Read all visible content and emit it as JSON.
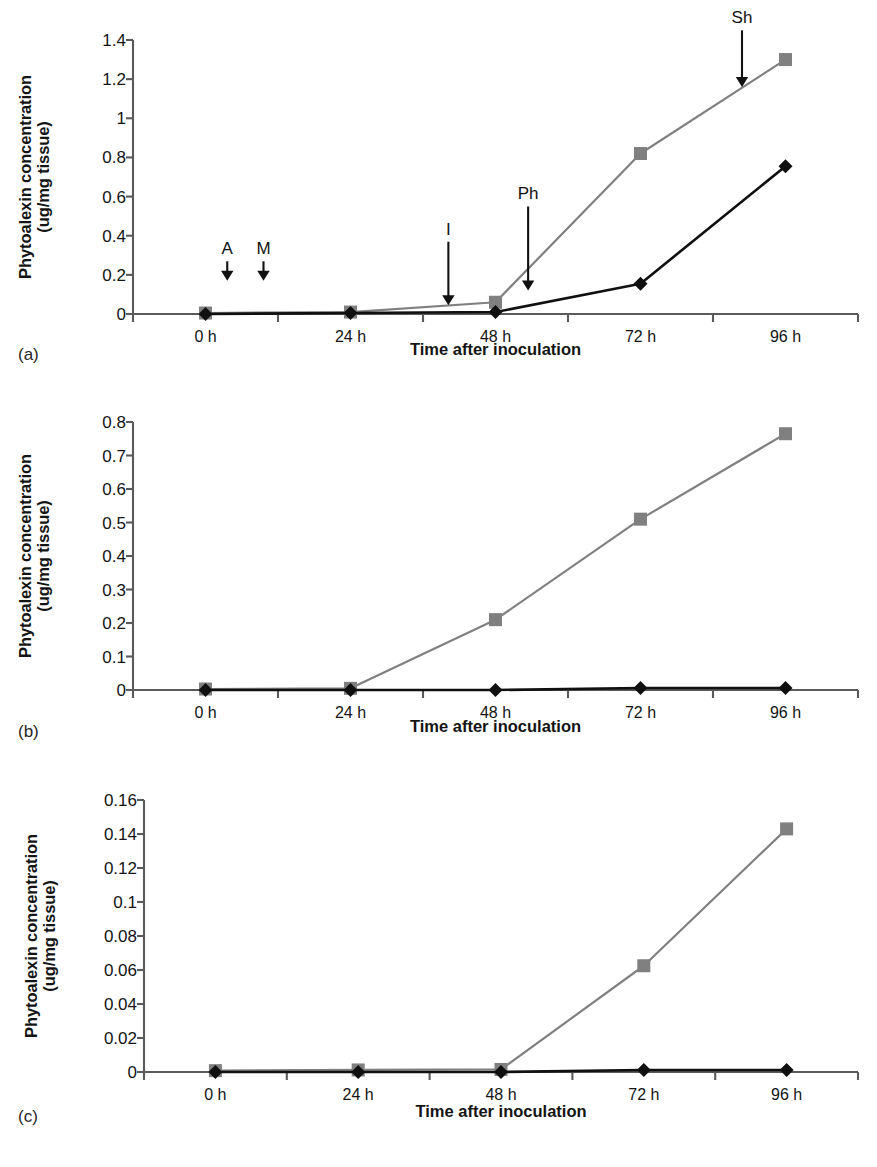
{
  "figure": {
    "background": "#ffffff",
    "series_colors": {
      "squares": "#808080",
      "diamonds": "#101010"
    },
    "axis_color": "#5a5a5a"
  },
  "axis_titles": {
    "y_line1": "Phytoalexin concentration",
    "y_line2": "(ug/mg tissue)",
    "x": "Time after inoculation"
  },
  "panel_letters": {
    "a": "(a)",
    "b": "(b)",
    "c": "(c)"
  },
  "annotations": {
    "a": "A",
    "m": "M",
    "i": "I",
    "ph": "Ph",
    "sh": "Sh"
  },
  "chart_data": [
    {
      "id": "a",
      "type": "line",
      "title": "",
      "panel_label": "(a)",
      "xlabel": "Time after inoculation",
      "ylabel": "Phytoalexin concentration (ug/mg tissue)",
      "categories": [
        "0 h",
        "24 h",
        "48 h",
        "72 h",
        "96 h"
      ],
      "ylim": [
        0,
        1.4
      ],
      "ytick_step": 0.2,
      "yticks": [
        0,
        0.2,
        0.4,
        0.6,
        0.8,
        1,
        1.2,
        1.4
      ],
      "ytick_labels": [
        "0",
        "0.2",
        "0.4",
        "0.6",
        "0.8",
        "1",
        "1.2",
        "1.4"
      ],
      "grid": false,
      "legend": "none",
      "series": [
        {
          "name": "squares",
          "marker": "square",
          "color": "#808080",
          "values": [
            0.005,
            0.01,
            0.06,
            0.82,
            1.3
          ]
        },
        {
          "name": "diamonds",
          "marker": "diamond",
          "color": "#101010",
          "values": [
            0.0,
            0.005,
            0.01,
            0.155,
            0.755
          ]
        }
      ],
      "annotations": [
        {
          "label": "A",
          "x_frac": 0.13,
          "tip_y": 0.17,
          "label_y": 0.3
        },
        {
          "label": "M",
          "x_frac": 0.18,
          "tip_y": 0.17,
          "label_y": 0.3
        },
        {
          "label": "I",
          "x_frac": 0.435,
          "tip_y": 0.045,
          "label_y": 0.4
        },
        {
          "label": "Ph",
          "x_frac": 0.545,
          "tip_y": 0.12,
          "label_y": 0.58
        },
        {
          "label": "Sh",
          "x_frac": 0.84,
          "tip_y": 1.16,
          "label_y": 1.48
        }
      ]
    },
    {
      "id": "b",
      "type": "line",
      "title": "",
      "panel_label": "(b)",
      "xlabel": "Time after inoculation",
      "ylabel": "Phytoalexin concentration (ug/mg tissue)",
      "categories": [
        "0 h",
        "24 h",
        "48 h",
        "72 h",
        "96 h"
      ],
      "ylim": [
        0,
        0.8
      ],
      "ytick_step": 0.1,
      "yticks": [
        0,
        0.1,
        0.2,
        0.3,
        0.4,
        0.5,
        0.6,
        0.7,
        0.8
      ],
      "ytick_labels": [
        "0",
        "0.1",
        "0.2",
        "0.3",
        "0.4",
        "0.5",
        "0.6",
        "0.7",
        "0.8"
      ],
      "grid": false,
      "legend": "none",
      "series": [
        {
          "name": "squares",
          "marker": "square",
          "color": "#808080",
          "values": [
            0.003,
            0.005,
            0.21,
            0.51,
            0.765
          ]
        },
        {
          "name": "diamonds",
          "marker": "diamond",
          "color": "#101010",
          "values": [
            0.0,
            0.0,
            0.0,
            0.006,
            0.006
          ]
        }
      ],
      "annotations": []
    },
    {
      "id": "c",
      "type": "line",
      "title": "",
      "panel_label": "(c)",
      "xlabel": "Time after inoculation",
      "ylabel": "Phytoalexin concentration (ug/mg tissue)",
      "categories": [
        "0 h",
        "24 h",
        "48 h",
        "72 h",
        "96 h"
      ],
      "ylim": [
        0,
        0.16
      ],
      "ytick_step": 0.02,
      "yticks": [
        0,
        0.02,
        0.04,
        0.06,
        0.08,
        0.1,
        0.12,
        0.14,
        0.16
      ],
      "ytick_labels": [
        "0",
        "0.02",
        "0.04",
        "0.06",
        "0.08",
        "0.1",
        "0.12",
        "0.14",
        "0.16"
      ],
      "grid": false,
      "legend": "none",
      "series": [
        {
          "name": "squares",
          "marker": "square",
          "color": "#808080",
          "values": [
            0.0008,
            0.0012,
            0.0015,
            0.0625,
            0.143
          ]
        },
        {
          "name": "diamonds",
          "marker": "diamond",
          "color": "#101010",
          "values": [
            0.0,
            0.0,
            0.0,
            0.0012,
            0.0012
          ]
        }
      ],
      "annotations": []
    }
  ]
}
